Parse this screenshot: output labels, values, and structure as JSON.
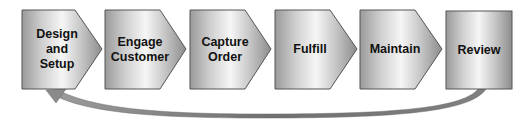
{
  "diagram": {
    "steps": [
      {
        "label": "Design\nand\nSetup"
      },
      {
        "label": "Engage\nCustomer"
      },
      {
        "label": "Capture\nOrder"
      },
      {
        "label": "Fulfill"
      },
      {
        "label": "Maintain"
      },
      {
        "label": "Review"
      }
    ],
    "return_arrow": {
      "from": "Review",
      "to": "Design and Setup"
    },
    "colors": {
      "shape_light": "#f4f4f4",
      "shape_mid": "#c8c8c8",
      "shape_dark": "#8c8c8c",
      "outline": "#555555",
      "arrow": "#8a8a8a",
      "text": "#111111"
    }
  }
}
